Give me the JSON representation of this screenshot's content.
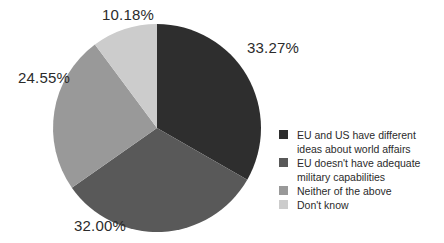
{
  "figure": {
    "width": 444,
    "height": 243,
    "background": "#ffffff",
    "text_color": "#2b2b2b"
  },
  "chart_data": {
    "type": "pie",
    "title": "",
    "start_angle_deg": 0,
    "direction": "clockwise",
    "legend_position": "right",
    "center_x": 157,
    "center_y": 128,
    "radius": 104,
    "slices": [
      {
        "label": "EU and US have different ideas about world affairs",
        "value": 33.27,
        "display": "33.27%",
        "color": "#2e2e2e",
        "label_x": 247,
        "label_y": 40
      },
      {
        "label": "EU doesn't have adequate military capabilities",
        "value": 32.0,
        "display": "32.00%",
        "color": "#595959",
        "label_x": 74,
        "label_y": 218
      },
      {
        "label": "Neither of the above",
        "value": 24.55,
        "display": "24.55%",
        "color": "#999999",
        "label_x": 18,
        "label_y": 70
      },
      {
        "label": "Don't know",
        "value": 10.18,
        "display": "10.18%",
        "color": "#cccccc",
        "label_x": 102,
        "label_y": 7
      }
    ]
  }
}
